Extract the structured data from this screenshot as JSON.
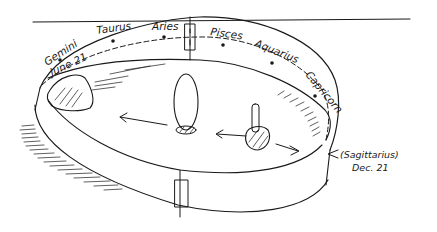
{
  "diagram": {
    "type": "hand-drawn circular zodiac enclosure",
    "zodiac_labels": {
      "gemini": "Gemini",
      "june": "June 21",
      "taurus": "Taurus",
      "aries": "Aries",
      "pisces": "Pisces",
      "aquarius": "Aquarius",
      "capricorn": "Capricorn",
      "sagittarius": "(Sagittarius)",
      "december": "Dec. 21"
    },
    "ink_color": "#1a1a1a",
    "background": "#ffffff"
  }
}
